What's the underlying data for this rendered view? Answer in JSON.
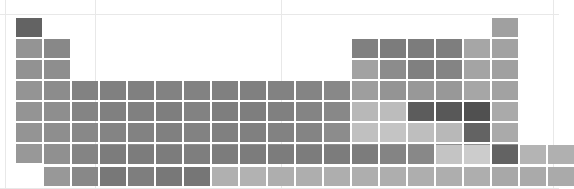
{
  "figure": {
    "type": "periodic-table-heatmap",
    "title": "",
    "background": "#ffffff",
    "gridline_color": "#e8e8e8",
    "cell_gap_px": 2,
    "columns": 18,
    "main_rows": 7,
    "inner_block_rows": 2,
    "colormap": "greys",
    "value_range": [
      0,
      1
    ]
  },
  "background_gridlines": {
    "vertical_x": [
      5,
      95,
      281,
      553
    ],
    "horizontal_y": [
      14,
      188
    ]
  },
  "layout": {
    "origin_x": 16,
    "origin_y": 18,
    "cell_w": 28,
    "cell_h": 21,
    "lanth_row_y": [
      145,
      167
    ],
    "lanth_start_col": 2
  },
  "chart_data": {
    "type": "heatmap",
    "title": "",
    "xlabel": "",
    "ylabel": "",
    "grid": true,
    "legend": "none",
    "categories": [
      "group 1",
      "group 2",
      "group 3",
      "group 4",
      "group 5",
      "group 6",
      "group 7",
      "group 8",
      "group 9",
      "group 10",
      "group 11",
      "group 12",
      "group 13",
      "group 14",
      "group 15",
      "group 16",
      "group 17",
      "group 18"
    ],
    "cells": [
      {
        "symbol": "H",
        "z": 1,
        "col": 1,
        "row": 1,
        "value": 0.62,
        "color": "#636363"
      },
      {
        "symbol": "He",
        "z": 2,
        "col": 18,
        "row": 1,
        "value": 0.38,
        "color": "#a0a0a0"
      },
      {
        "symbol": "Li",
        "z": 3,
        "col": 1,
        "row": 2,
        "value": 0.44,
        "color": "#949494"
      },
      {
        "symbol": "Be",
        "z": 4,
        "col": 2,
        "row": 2,
        "value": 0.5,
        "color": "#888888"
      },
      {
        "symbol": "B",
        "z": 5,
        "col": 13,
        "row": 2,
        "value": 0.54,
        "color": "#808080"
      },
      {
        "symbol": "C",
        "z": 6,
        "col": 14,
        "row": 2,
        "value": 0.56,
        "color": "#7c7c7c"
      },
      {
        "symbol": "N",
        "z": 7,
        "col": 15,
        "row": 2,
        "value": 0.56,
        "color": "#7c7c7c"
      },
      {
        "symbol": "O",
        "z": 8,
        "col": 16,
        "row": 2,
        "value": 0.55,
        "color": "#7e7e7e"
      },
      {
        "symbol": "F",
        "z": 9,
        "col": 17,
        "row": 2,
        "value": 0.36,
        "color": "#a6a6a6"
      },
      {
        "symbol": "Ne",
        "z": 10,
        "col": 18,
        "row": 2,
        "value": 0.38,
        "color": "#a2a2a2"
      },
      {
        "symbol": "Na",
        "z": 11,
        "col": 1,
        "row": 3,
        "value": 0.45,
        "color": "#929292"
      },
      {
        "symbol": "Mg",
        "z": 12,
        "col": 2,
        "row": 3,
        "value": 0.47,
        "color": "#8e8e8e"
      },
      {
        "symbol": "Al",
        "z": 13,
        "col": 13,
        "row": 3,
        "value": 0.38,
        "color": "#a2a2a2"
      },
      {
        "symbol": "Si",
        "z": 14,
        "col": 14,
        "row": 3,
        "value": 0.48,
        "color": "#8c8c8c"
      },
      {
        "symbol": "P",
        "z": 15,
        "col": 15,
        "row": 3,
        "value": 0.54,
        "color": "#808080"
      },
      {
        "symbol": "S",
        "z": 16,
        "col": 16,
        "row": 3,
        "value": 0.52,
        "color": "#848484"
      },
      {
        "symbol": "Cl",
        "z": 17,
        "col": 17,
        "row": 3,
        "value": 0.37,
        "color": "#a4a4a4"
      },
      {
        "symbol": "Ar",
        "z": 18,
        "col": 18,
        "row": 3,
        "value": 0.39,
        "color": "#a0a0a0"
      },
      {
        "symbol": "K",
        "z": 19,
        "col": 1,
        "row": 4,
        "value": 0.44,
        "color": "#949494"
      },
      {
        "symbol": "Ca",
        "z": 20,
        "col": 2,
        "row": 4,
        "value": 0.48,
        "color": "#8c8c8c"
      },
      {
        "symbol": "Sc",
        "z": 21,
        "col": 3,
        "row": 4,
        "value": 0.53,
        "color": "#828282"
      },
      {
        "symbol": "Ti",
        "z": 22,
        "col": 4,
        "row": 4,
        "value": 0.54,
        "color": "#808080"
      },
      {
        "symbol": "V",
        "z": 23,
        "col": 5,
        "row": 4,
        "value": 0.54,
        "color": "#808080"
      },
      {
        "symbol": "Cr",
        "z": 24,
        "col": 6,
        "row": 4,
        "value": 0.53,
        "color": "#828282"
      },
      {
        "symbol": "Mn",
        "z": 25,
        "col": 7,
        "row": 4,
        "value": 0.53,
        "color": "#828282"
      },
      {
        "symbol": "Fe",
        "z": 26,
        "col": 8,
        "row": 4,
        "value": 0.54,
        "color": "#808080"
      },
      {
        "symbol": "Co",
        "z": 27,
        "col": 9,
        "row": 4,
        "value": 0.54,
        "color": "#808080"
      },
      {
        "symbol": "Ni",
        "z": 28,
        "col": 10,
        "row": 4,
        "value": 0.53,
        "color": "#828282"
      },
      {
        "symbol": "Cu",
        "z": 29,
        "col": 11,
        "row": 4,
        "value": 0.52,
        "color": "#848484"
      },
      {
        "symbol": "Zn",
        "z": 30,
        "col": 12,
        "row": 4,
        "value": 0.5,
        "color": "#888888"
      },
      {
        "symbol": "Ga",
        "z": 31,
        "col": 13,
        "row": 4,
        "value": 0.4,
        "color": "#9e9e9e"
      },
      {
        "symbol": "Ge",
        "z": 32,
        "col": 14,
        "row": 4,
        "value": 0.44,
        "color": "#949494"
      },
      {
        "symbol": "As",
        "z": 33,
        "col": 15,
        "row": 4,
        "value": 0.42,
        "color": "#989898"
      },
      {
        "symbol": "Se",
        "z": 34,
        "col": 16,
        "row": 4,
        "value": 0.42,
        "color": "#989898"
      },
      {
        "symbol": "Br",
        "z": 35,
        "col": 17,
        "row": 4,
        "value": 0.36,
        "color": "#a6a6a6"
      },
      {
        "symbol": "Kr",
        "z": 36,
        "col": 18,
        "row": 4,
        "value": 0.38,
        "color": "#a2a2a2"
      },
      {
        "symbol": "Rb",
        "z": 37,
        "col": 1,
        "row": 5,
        "value": 0.44,
        "color": "#949494"
      },
      {
        "symbol": "Sr",
        "z": 38,
        "col": 2,
        "row": 5,
        "value": 0.47,
        "color": "#8e8e8e"
      },
      {
        "symbol": "Y",
        "z": 39,
        "col": 3,
        "row": 5,
        "value": 0.52,
        "color": "#848484"
      },
      {
        "symbol": "Zr",
        "z": 40,
        "col": 4,
        "row": 5,
        "value": 0.54,
        "color": "#808080"
      },
      {
        "symbol": "Nb",
        "z": 41,
        "col": 5,
        "row": 5,
        "value": 0.54,
        "color": "#808080"
      },
      {
        "symbol": "Mo",
        "z": 42,
        "col": 6,
        "row": 5,
        "value": 0.55,
        "color": "#7e7e7e"
      },
      {
        "symbol": "Tc",
        "z": 43,
        "col": 7,
        "row": 5,
        "value": 0.53,
        "color": "#828282"
      },
      {
        "symbol": "Ru",
        "z": 44,
        "col": 8,
        "row": 5,
        "value": 0.55,
        "color": "#7e7e7e"
      },
      {
        "symbol": "Rh",
        "z": 45,
        "col": 9,
        "row": 5,
        "value": 0.55,
        "color": "#7e7e7e"
      },
      {
        "symbol": "Pd",
        "z": 46,
        "col": 10,
        "row": 5,
        "value": 0.54,
        "color": "#808080"
      },
      {
        "symbol": "Ag",
        "z": 47,
        "col": 11,
        "row": 5,
        "value": 0.52,
        "color": "#848484"
      },
      {
        "symbol": "Cd",
        "z": 48,
        "col": 12,
        "row": 5,
        "value": 0.5,
        "color": "#888888"
      },
      {
        "symbol": "In",
        "z": 49,
        "col": 13,
        "row": 5,
        "value": 0.28,
        "color": "#b8b8b8"
      },
      {
        "symbol": "Sn",
        "z": 50,
        "col": 14,
        "row": 5,
        "value": 0.26,
        "color": "#bcbcbc"
      },
      {
        "symbol": "Sb",
        "z": 51,
        "col": 15,
        "row": 5,
        "value": 0.66,
        "color": "#5c5c5c"
      },
      {
        "symbol": "Te",
        "z": 52,
        "col": 16,
        "row": 5,
        "value": 0.68,
        "color": "#585858"
      },
      {
        "symbol": "I",
        "z": 53,
        "col": 17,
        "row": 5,
        "value": 0.72,
        "color": "#505050"
      },
      {
        "symbol": "Xe",
        "z": 54,
        "col": 18,
        "row": 5,
        "value": 0.34,
        "color": "#aaaaaa"
      },
      {
        "symbol": "Cs",
        "z": 55,
        "col": 1,
        "row": 6,
        "value": 0.44,
        "color": "#949494"
      },
      {
        "symbol": "Ba",
        "z": 56,
        "col": 2,
        "row": 6,
        "value": 0.47,
        "color": "#8e8e8e"
      },
      {
        "symbol": "La",
        "z": 57,
        "col": 3,
        "row": 6,
        "value": 0.5,
        "color": "#888888"
      },
      {
        "symbol": "Hf",
        "z": 72,
        "col": 4,
        "row": 6,
        "value": 0.52,
        "color": "#848484"
      },
      {
        "symbol": "Ta",
        "z": 73,
        "col": 5,
        "row": 6,
        "value": 0.53,
        "color": "#828282"
      },
      {
        "symbol": "W",
        "z": 74,
        "col": 6,
        "row": 6,
        "value": 0.54,
        "color": "#808080"
      },
      {
        "symbol": "Re",
        "z": 75,
        "col": 7,
        "row": 6,
        "value": 0.53,
        "color": "#828282"
      },
      {
        "symbol": "Os",
        "z": 76,
        "col": 8,
        "row": 6,
        "value": 0.54,
        "color": "#808080"
      },
      {
        "symbol": "Ir",
        "z": 77,
        "col": 9,
        "row": 6,
        "value": 0.54,
        "color": "#808080"
      },
      {
        "symbol": "Pt",
        "z": 78,
        "col": 10,
        "row": 6,
        "value": 0.53,
        "color": "#828282"
      },
      {
        "symbol": "Au",
        "z": 79,
        "col": 11,
        "row": 6,
        "value": 0.52,
        "color": "#848484"
      },
      {
        "symbol": "Hg",
        "z": 80,
        "col": 12,
        "row": 6,
        "value": 0.48,
        "color": "#8c8c8c"
      },
      {
        "symbol": "Tl",
        "z": 81,
        "col": 13,
        "row": 6,
        "value": 0.24,
        "color": "#c0c0c0"
      },
      {
        "symbol": "Pb",
        "z": 82,
        "col": 14,
        "row": 6,
        "value": 0.22,
        "color": "#c4c4c4"
      },
      {
        "symbol": "Bi",
        "z": 83,
        "col": 15,
        "row": 6,
        "value": 0.25,
        "color": "#bebebe"
      },
      {
        "symbol": "Po",
        "z": 84,
        "col": 16,
        "row": 6,
        "value": 0.28,
        "color": "#b8b8b8"
      },
      {
        "symbol": "At",
        "z": 85,
        "col": 17,
        "row": 6,
        "value": 0.62,
        "color": "#636363"
      },
      {
        "symbol": "Rn",
        "z": 86,
        "col": 18,
        "row": 6,
        "value": 0.34,
        "color": "#aaaaaa"
      },
      {
        "symbol": "Fr",
        "z": 87,
        "col": 1,
        "row": 7,
        "value": 0.42,
        "color": "#989898"
      },
      {
        "symbol": "Ra",
        "z": 88,
        "col": 2,
        "row": 7,
        "value": 0.45,
        "color": "#929292"
      },
      {
        "symbol": "Ac",
        "z": 89,
        "col": 3,
        "row": 7,
        "value": 0.46,
        "color": "#909090"
      },
      {
        "symbol": "Rf",
        "z": 104,
        "col": 4,
        "row": 7,
        "value": 0.46,
        "color": "#909090"
      },
      {
        "symbol": "Db",
        "z": 105,
        "col": 5,
        "row": 7,
        "value": 0.46,
        "color": "#909090"
      },
      {
        "symbol": "Sg",
        "z": 106,
        "col": 6,
        "row": 7,
        "value": 0.46,
        "color": "#909090"
      },
      {
        "symbol": "Bh",
        "z": 107,
        "col": 7,
        "row": 7,
        "value": 0.46,
        "color": "#909090"
      },
      {
        "symbol": "Hs",
        "z": 108,
        "col": 8,
        "row": 7,
        "value": 0.46,
        "color": "#909090"
      },
      {
        "symbol": "Mt",
        "z": 109,
        "col": 9,
        "row": 7,
        "value": 0.46,
        "color": "#909090"
      },
      {
        "symbol": "Ds",
        "z": 110,
        "col": 10,
        "row": 7,
        "value": 0.46,
        "color": "#909090"
      },
      {
        "symbol": "Rg",
        "z": 111,
        "col": 11,
        "row": 7,
        "value": 0.46,
        "color": "#909090"
      },
      {
        "symbol": "Cn",
        "z": 112,
        "col": 12,
        "row": 7,
        "value": 0.46,
        "color": "#909090"
      },
      {
        "symbol": "Nh",
        "z": 113,
        "col": 13,
        "row": 7,
        "value": 0.46,
        "color": "#909090"
      },
      {
        "symbol": "Fl",
        "z": 114,
        "col": 14,
        "row": 7,
        "value": 0.46,
        "color": "#909090"
      },
      {
        "symbol": "Mc",
        "z": 115,
        "col": 15,
        "row": 7,
        "value": 0.46,
        "color": "#909090"
      },
      {
        "symbol": "Lv",
        "z": 116,
        "col": 16,
        "row": 7,
        "value": 0.46,
        "color": "#909090"
      },
      {
        "symbol": "Ts",
        "z": 117,
        "col": 17,
        "row": 7,
        "value": 0.46,
        "color": "#909090"
      },
      {
        "symbol": "Og",
        "z": 118,
        "col": 18,
        "row": 7,
        "value": 0.46,
        "color": "#909090"
      }
    ],
    "lanthanides": [
      {
        "symbol": "Ce",
        "z": 58,
        "slot": 1,
        "value": 0.46,
        "color": "#909090"
      },
      {
        "symbol": "Pr",
        "z": 59,
        "slot": 2,
        "value": 0.52,
        "color": "#848484"
      },
      {
        "symbol": "Nd",
        "z": 60,
        "slot": 3,
        "value": 0.56,
        "color": "#7c7c7c"
      },
      {
        "symbol": "Pm",
        "z": 61,
        "slot": 4,
        "value": 0.56,
        "color": "#7c7c7c"
      },
      {
        "symbol": "Sm",
        "z": 62,
        "slot": 5,
        "value": 0.56,
        "color": "#7c7c7c"
      },
      {
        "symbol": "Eu",
        "z": 63,
        "slot": 6,
        "value": 0.55,
        "color": "#7e7e7e"
      },
      {
        "symbol": "Gd",
        "z": 64,
        "slot": 7,
        "value": 0.56,
        "color": "#7c7c7c"
      },
      {
        "symbol": "Tb",
        "z": 65,
        "slot": 8,
        "value": 0.56,
        "color": "#7c7c7c"
      },
      {
        "symbol": "Dy",
        "z": 66,
        "slot": 9,
        "value": 0.56,
        "color": "#7c7c7c"
      },
      {
        "symbol": "Ho",
        "z": 67,
        "slot": 10,
        "value": 0.56,
        "color": "#7c7c7c"
      },
      {
        "symbol": "Er",
        "z": 68,
        "slot": 11,
        "value": 0.56,
        "color": "#7c7c7c"
      },
      {
        "symbol": "Tm",
        "z": 69,
        "slot": 12,
        "value": 0.56,
        "color": "#7c7c7c"
      },
      {
        "symbol": "Yb",
        "z": 70,
        "slot": 13,
        "value": 0.52,
        "color": "#848484"
      },
      {
        "symbol": "Lu",
        "z": 71,
        "slot": 14,
        "value": 0.5,
        "color": "#888888"
      },
      {
        "symbol": "-",
        "z": 0,
        "slot": 15,
        "value": 0.22,
        "color": "#c4c4c4"
      },
      {
        "symbol": "-",
        "z": 0,
        "slot": 16,
        "value": 0.18,
        "color": "#cccccc"
      },
      {
        "symbol": "-",
        "z": 0,
        "slot": 17,
        "value": 0.62,
        "color": "#636363"
      },
      {
        "symbol": "-",
        "z": 0,
        "slot": 18,
        "value": 0.3,
        "color": "#b4b4b4"
      },
      {
        "symbol": "-",
        "z": 0,
        "slot": 19,
        "value": 0.32,
        "color": "#b0b0b0"
      }
    ],
    "actinides": [
      {
        "symbol": "Th",
        "z": 90,
        "slot": 1,
        "value": 0.42,
        "color": "#989898"
      },
      {
        "symbol": "Pa",
        "z": 91,
        "slot": 2,
        "value": 0.5,
        "color": "#888888"
      },
      {
        "symbol": "U",
        "z": 92,
        "slot": 3,
        "value": 0.58,
        "color": "#787878"
      },
      {
        "symbol": "Np",
        "z": 93,
        "slot": 4,
        "value": 0.55,
        "color": "#7e7e7e"
      },
      {
        "symbol": "Pu",
        "z": 94,
        "slot": 5,
        "value": 0.58,
        "color": "#787878"
      },
      {
        "symbol": "Am",
        "z": 95,
        "slot": 6,
        "value": 0.59,
        "color": "#767676"
      },
      {
        "symbol": "Cm",
        "z": 96,
        "slot": 7,
        "value": 0.32,
        "color": "#b0b0b0"
      },
      {
        "symbol": "Bk",
        "z": 97,
        "slot": 8,
        "value": 0.31,
        "color": "#b2b2b2"
      },
      {
        "symbol": "Cf",
        "z": 98,
        "slot": 9,
        "value": 0.33,
        "color": "#aeaeae"
      },
      {
        "symbol": "Es",
        "z": 99,
        "slot": 10,
        "value": 0.33,
        "color": "#aeaeae"
      },
      {
        "symbol": "Fm",
        "z": 100,
        "slot": 11,
        "value": 0.33,
        "color": "#aeaeae"
      },
      {
        "symbol": "Md",
        "z": 101,
        "slot": 12,
        "value": 0.33,
        "color": "#aeaeae"
      },
      {
        "symbol": "No",
        "z": 102,
        "slot": 13,
        "value": 0.33,
        "color": "#aeaeae"
      },
      {
        "symbol": "Lr",
        "z": 103,
        "slot": 14,
        "value": 0.33,
        "color": "#aeaeae"
      },
      {
        "symbol": "-",
        "z": 0,
        "slot": 15,
        "value": 0.33,
        "color": "#aeaeae"
      },
      {
        "symbol": "-",
        "z": 0,
        "slot": 16,
        "value": 0.33,
        "color": "#aeaeae"
      },
      {
        "symbol": "-",
        "z": 0,
        "slot": 17,
        "value": 0.35,
        "color": "#a8a8a8"
      },
      {
        "symbol": "-",
        "z": 0,
        "slot": 18,
        "value": 0.34,
        "color": "#aaaaaa"
      },
      {
        "symbol": "-",
        "z": 0,
        "slot": 19,
        "value": 0.34,
        "color": "#aaaaaa"
      }
    ]
  }
}
